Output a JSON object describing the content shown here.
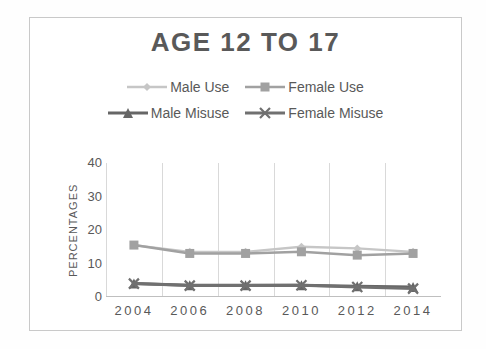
{
  "colors": {
    "text": "#595959",
    "gridline": "#d9d9d9",
    "axis_line": "#bfbfbf",
    "frame_border": "#c9c9c9",
    "background": "#ffffff"
  },
  "chart_data": {
    "type": "line",
    "title": "AGE 12 TO 17",
    "ylabel": "PERCENTAGES",
    "xlabel": "",
    "categories": [
      "2004",
      "2006",
      "2008",
      "2010",
      "2012",
      "2014"
    ],
    "series": [
      {
        "name": "Male Use",
        "marker": "diamond",
        "color": "#c6c6c6",
        "line_width": 2.3,
        "values": [
          15.5,
          13.5,
          13.5,
          15.0,
          14.5,
          13.5
        ]
      },
      {
        "name": "Female Use",
        "marker": "square",
        "color": "#a1a1a1",
        "line_width": 2.5,
        "values": [
          15.5,
          13.0,
          13.0,
          13.5,
          12.5,
          13.0
        ]
      },
      {
        "name": "Male Misuse",
        "marker": "triangle",
        "color": "#666666",
        "line_width": 3.0,
        "values": [
          4.0,
          3.5,
          3.5,
          3.5,
          3.2,
          3.0
        ]
      },
      {
        "name": "Female Misuse",
        "marker": "x",
        "color": "#707070",
        "line_width": 3.0,
        "values": [
          4.0,
          3.4,
          3.4,
          3.5,
          3.0,
          2.5
        ]
      }
    ],
    "ylim": [
      0,
      40
    ],
    "yticks": [
      0,
      10,
      20,
      30,
      40
    ],
    "grid": "vertical",
    "legend_position": "top"
  }
}
